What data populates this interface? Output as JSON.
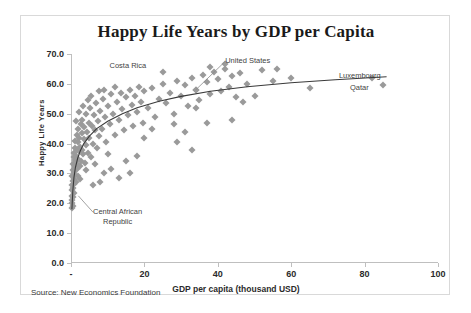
{
  "card": {
    "source_note": "Source: New Economics Foundation"
  },
  "chart_data": {
    "type": "scatter",
    "title": "Happy Life Years by GDP per Capita",
    "xlabel": "GDP per capita (thousand USD)",
    "ylabel": "Happy Life Years",
    "xlim": [
      0,
      100
    ],
    "ylim": [
      0,
      70
    ],
    "xticks": [
      0,
      20,
      40,
      60,
      80,
      100
    ],
    "xtick_labels": [
      "-",
      "20",
      "40",
      "60",
      "80",
      "100"
    ],
    "yticks": [
      0,
      10,
      20,
      30,
      40,
      50,
      60,
      70
    ],
    "ytick_labels": [
      "0.0",
      "10.0",
      "20.0",
      "30.0",
      "40.0",
      "50.0",
      "60.0",
      "70.0"
    ],
    "grid": false,
    "legend": "none",
    "marker": {
      "shape": "diamond",
      "color": "#9a9a9a",
      "size": 5
    },
    "trend": {
      "type": "logarithmic",
      "color": "#3a3a3a",
      "points": [
        [
          0.25,
          18.0
        ],
        [
          0.5,
          24.0
        ],
        [
          0.8,
          28.5
        ],
        [
          1.2,
          32.0
        ],
        [
          1.8,
          35.0
        ],
        [
          2.5,
          37.5
        ],
        [
          3.5,
          40.0
        ],
        [
          5.0,
          42.5
        ],
        [
          7.0,
          45.0
        ],
        [
          10.0,
          47.5
        ],
        [
          14.0,
          50.0
        ],
        [
          18.0,
          52.0
        ],
        [
          24.0,
          54.2
        ],
        [
          30.0,
          55.8
        ],
        [
          38.0,
          57.5
        ],
        [
          48.0,
          59.0
        ],
        [
          60.0,
          60.4
        ],
        [
          72.0,
          61.4
        ],
        [
          86.0,
          62.4
        ]
      ]
    },
    "annotations": [
      {
        "label": "Costa Rica",
        "x": 10.5,
        "y": 66.0,
        "leader": false
      },
      {
        "label": "United States",
        "x": 42.0,
        "y": 67.5,
        "leader": true,
        "leader_to_x": 34.0,
        "leader_to_y": 58.0
      },
      {
        "label": "Luxembourg",
        "x": 73.0,
        "y": 62.5,
        "leader": false
      },
      {
        "label": "Qatar",
        "x": 76.0,
        "y": 58.5,
        "leader": false
      },
      {
        "label": "Central African\nRepublic",
        "x": 6.0,
        "y": 17.0,
        "leader": true,
        "leader_to_x": 2.0,
        "leader_to_y": 22.5
      }
    ],
    "points": [
      [
        0.3,
        21.0
      ],
      [
        0.3,
        24.5
      ],
      [
        0.4,
        26.0
      ],
      [
        0.4,
        29.0
      ],
      [
        0.5,
        22.0
      ],
      [
        0.5,
        27.5
      ],
      [
        0.5,
        31.0
      ],
      [
        0.6,
        25.0
      ],
      [
        0.6,
        33.0
      ],
      [
        0.7,
        28.0
      ],
      [
        0.7,
        35.5
      ],
      [
        0.8,
        23.5
      ],
      [
        0.8,
        30.5
      ],
      [
        0.9,
        37.0
      ],
      [
        0.9,
        26.5
      ],
      [
        1.0,
        32.0
      ],
      [
        1.0,
        38.5
      ],
      [
        1.1,
        29.5
      ],
      [
        1.2,
        34.5
      ],
      [
        1.2,
        41.0
      ],
      [
        1.3,
        27.0
      ],
      [
        1.4,
        36.0
      ],
      [
        1.5,
        31.5
      ],
      [
        1.5,
        43.0
      ],
      [
        1.6,
        38.0
      ],
      [
        1.7,
        33.0
      ],
      [
        1.8,
        40.5
      ],
      [
        1.9,
        29.0
      ],
      [
        2.0,
        35.0
      ],
      [
        2.0,
        45.0
      ],
      [
        2.2,
        37.5
      ],
      [
        2.3,
        42.0
      ],
      [
        2.4,
        32.5
      ],
      [
        2.5,
        39.0
      ],
      [
        2.6,
        46.5
      ],
      [
        2.8,
        34.0
      ],
      [
        2.9,
        43.5
      ],
      [
        3.0,
        38.0
      ],
      [
        3.1,
        48.0
      ],
      [
        3.3,
        36.5
      ],
      [
        3.5,
        41.5
      ],
      [
        3.6,
        45.5
      ],
      [
        3.8,
        33.5
      ],
      [
        4.0,
        39.5
      ],
      [
        4.2,
        50.0
      ],
      [
        4.4,
        44.0
      ],
      [
        4.6,
        37.0
      ],
      [
        4.8,
        47.0
      ],
      [
        5.0,
        42.0
      ],
      [
        5.2,
        52.0
      ],
      [
        5.5,
        35.5
      ],
      [
        5.8,
        46.0
      ],
      [
        6.0,
        40.0
      ],
      [
        6.2,
        49.5
      ],
      [
        6.5,
        44.5
      ],
      [
        6.8,
        53.5
      ],
      [
        7.0,
        38.5
      ],
      [
        7.3,
        47.5
      ],
      [
        7.6,
        42.5
      ],
      [
        8.0,
        51.0
      ],
      [
        8.4,
        45.0
      ],
      [
        8.8,
        55.0
      ],
      [
        9.2,
        49.0
      ],
      [
        9.5,
        40.5
      ],
      [
        10.0,
        52.5
      ],
      [
        10.5,
        46.5
      ],
      [
        11.0,
        56.5
      ],
      [
        11.5,
        50.0
      ],
      [
        12.0,
        43.0
      ],
      [
        12.5,
        54.0
      ],
      [
        13.0,
        48.0
      ],
      [
        13.5,
        57.0
      ],
      [
        14.0,
        51.5
      ],
      [
        14.5,
        44.5
      ],
      [
        15.0,
        55.5
      ],
      [
        15.5,
        49.5
      ],
      [
        16.0,
        58.0
      ],
      [
        16.5,
        53.0
      ],
      [
        17.0,
        46.0
      ],
      [
        17.5,
        56.0
      ],
      [
        18.0,
        50.5
      ],
      [
        18.5,
        59.0
      ],
      [
        19.0,
        54.0
      ],
      [
        19.5,
        47.0
      ],
      [
        20.0,
        57.5
      ],
      [
        13.0,
        28.5
      ],
      [
        16.0,
        30.0
      ],
      [
        11.0,
        31.5
      ],
      [
        8.0,
        27.0
      ],
      [
        6.0,
        26.0
      ],
      [
        21.0,
        52.0
      ],
      [
        22.0,
        58.5
      ],
      [
        23.0,
        49.0
      ],
      [
        24.0,
        55.0
      ],
      [
        25.0,
        60.0
      ],
      [
        26.0,
        53.5
      ],
      [
        27.0,
        57.0
      ],
      [
        28.0,
        50.0
      ],
      [
        29.0,
        61.0
      ],
      [
        30.0,
        56.0
      ],
      [
        31.0,
        59.5
      ],
      [
        32.0,
        52.5
      ],
      [
        33.0,
        62.0
      ],
      [
        34.0,
        58.0
      ],
      [
        35.0,
        54.5
      ],
      [
        36.0,
        63.0
      ],
      [
        37.0,
        60.5
      ],
      [
        38.0,
        56.5
      ],
      [
        39.0,
        64.0
      ],
      [
        40.0,
        61.5
      ],
      [
        41.0,
        57.5
      ],
      [
        42.0,
        65.0
      ],
      [
        43.0,
        59.0
      ],
      [
        44.0,
        62.5
      ],
      [
        45.0,
        55.5
      ],
      [
        34.0,
        58.0
      ],
      [
        34.0,
        52.0
      ],
      [
        28.0,
        46.5
      ],
      [
        31.0,
        44.0
      ],
      [
        37.0,
        47.0
      ],
      [
        46.0,
        63.5
      ],
      [
        48.0,
        60.0
      ],
      [
        50.0,
        56.0
      ],
      [
        52.0,
        64.5
      ],
      [
        55.0,
        61.0
      ],
      [
        42.0,
        66.5
      ],
      [
        38.0,
        65.5
      ],
      [
        25.0,
        64.0
      ],
      [
        22.0,
        45.0
      ],
      [
        20.0,
        42.0
      ],
      [
        47.0,
        54.0
      ],
      [
        44.0,
        48.0
      ],
      [
        29.0,
        40.5
      ],
      [
        33.0,
        38.0
      ],
      [
        60.0,
        62.0
      ],
      [
        65.0,
        58.5
      ],
      [
        82.0,
        62.0
      ],
      [
        85.0,
        59.5
      ],
      [
        56.0,
        65.0
      ],
      [
        18.0,
        36.0
      ],
      [
        15.0,
        34.0
      ],
      [
        9.0,
        30.0
      ],
      [
        0.3,
        18.5
      ],
      [
        0.4,
        20.0
      ],
      [
        0.6,
        19.0
      ],
      [
        0.35,
        22.5
      ],
      [
        2.1,
        50.5
      ],
      [
        3.2,
        52.5
      ],
      [
        1.4,
        47.5
      ],
      [
        4.5,
        54.5
      ],
      [
        7.5,
        57.5
      ],
      [
        5.5,
        56.0
      ],
      [
        12.0,
        59.0
      ],
      [
        9.0,
        58.0
      ],
      [
        6.5,
        33.0
      ],
      [
        10.0,
        36.5
      ],
      [
        4.0,
        31.0
      ],
      [
        2.5,
        28.0
      ]
    ]
  }
}
